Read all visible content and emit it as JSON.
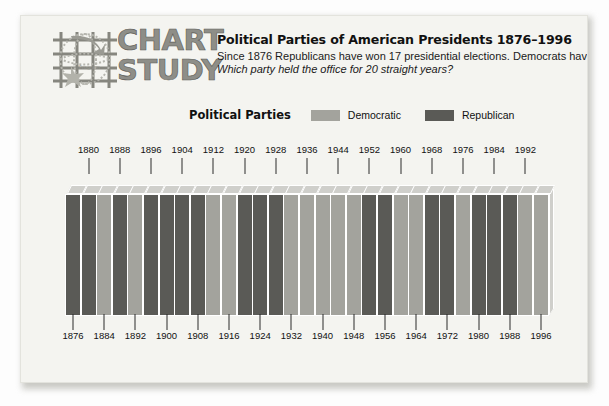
{
  "logo": {
    "line1": "CHART",
    "line2": "STUDY",
    "icon_name": "globe-grid-logo"
  },
  "header": {
    "title": "Political Parties of American Presidents 1876–1996",
    "subtitle_line1": "Since 1876 Republicans have won 17 presidential elections. Democrats have won 13.",
    "subtitle_line2": "Which party held the office for 20 straight years?"
  },
  "legend": {
    "title": "Political Parties",
    "items": [
      {
        "label": "Democratic",
        "color": "#a3a39d"
      },
      {
        "label": "Republican",
        "color": "#5a5a56"
      }
    ]
  },
  "colors": {
    "democratic": "#a3a39d",
    "republican": "#5a5a56",
    "bar_top": "#cfcfcb",
    "card_background": "#f4f4f0",
    "page_background": "#fdfdfd",
    "text": "#111111"
  },
  "chart_data": {
    "type": "bar",
    "title": "Political Parties of American Presidents 1876–1996",
    "xlabel": "",
    "ylabel": "",
    "grid": false,
    "legend_position": "top",
    "legend_entries": [
      "Democratic",
      "Republican"
    ],
    "note": "Each bar is one presidential election year; bar color encodes the winning party. All bars are the same height (categorical indicator, not a measured quantity).",
    "categories": [
      "1876",
      "1880",
      "1884",
      "1888",
      "1892",
      "1896",
      "1900",
      "1904",
      "1908",
      "1912",
      "1916",
      "1920",
      "1924",
      "1928",
      "1932",
      "1936",
      "1940",
      "1944",
      "1948",
      "1952",
      "1956",
      "1960",
      "1964",
      "1968",
      "1972",
      "1976",
      "1980",
      "1984",
      "1988",
      "1992",
      "1996"
    ],
    "labels_top": [
      "1880",
      "1888",
      "1896",
      "1904",
      "1912",
      "1920",
      "1928",
      "1936",
      "1944",
      "1952",
      "1960",
      "1968",
      "1976",
      "1984",
      "1992"
    ],
    "labels_bottom": [
      "1876",
      "1884",
      "1892",
      "1900",
      "1908",
      "1916",
      "1924",
      "1932",
      "1940",
      "1948",
      "1956",
      "1964",
      "1972",
      "1980",
      "1988",
      "1996"
    ],
    "values": [
      1,
      1,
      1,
      1,
      1,
      1,
      1,
      1,
      1,
      1,
      1,
      1,
      1,
      1,
      1,
      1,
      1,
      1,
      1,
      1,
      1,
      1,
      1,
      1,
      1,
      1,
      1,
      1,
      1,
      1,
      1
    ],
    "parties": [
      "Republican",
      "Republican",
      "Democratic",
      "Republican",
      "Democratic",
      "Republican",
      "Republican",
      "Republican",
      "Republican",
      "Democratic",
      "Democratic",
      "Republican",
      "Republican",
      "Republican",
      "Democratic",
      "Democratic",
      "Democratic",
      "Democratic",
      "Democratic",
      "Republican",
      "Republican",
      "Democratic",
      "Democratic",
      "Republican",
      "Republican",
      "Democratic",
      "Republican",
      "Republican",
      "Republican",
      "Democratic",
      "Democratic"
    ],
    "totals": {
      "Republican": 17,
      "Democratic": 13
    }
  }
}
